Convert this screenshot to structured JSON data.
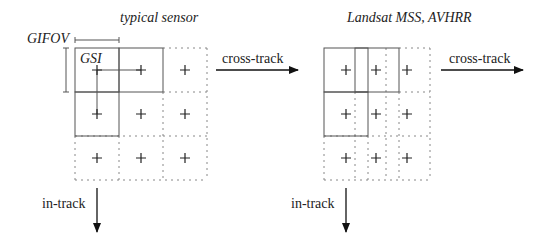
{
  "left_panel": {
    "title": "typical sensor",
    "gifov_label": "GIFOV",
    "gsi_label": "GSI",
    "cross_track_label": "cross-track",
    "in_track_label": "in-track"
  },
  "right_panel": {
    "title": "Landsat MSS, AVHRR",
    "cross_track_label": "cross-track",
    "in_track_label": "in-track"
  },
  "colors": {
    "line": "#555555",
    "dash": "#888888",
    "text": "#222222"
  }
}
